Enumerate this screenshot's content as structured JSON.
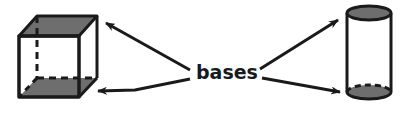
{
  "diagram": {
    "label": "bases",
    "shapes": [
      {
        "name": "cube",
        "description": "rectangular prism with shaded top and bottom bases"
      },
      {
        "name": "cylinder",
        "description": "cylinder with shaded top and bottom bases"
      }
    ],
    "arrows": [
      {
        "from": "bases",
        "to": "cube top base"
      },
      {
        "from": "bases",
        "to": "cube bottom base"
      },
      {
        "from": "bases",
        "to": "cylinder top base"
      },
      {
        "from": "bases",
        "to": "cylinder bottom base"
      }
    ],
    "colors": {
      "stroke": "#1a1a1a",
      "base_fill": "#6e6e6e",
      "background": "#ffffff"
    }
  }
}
